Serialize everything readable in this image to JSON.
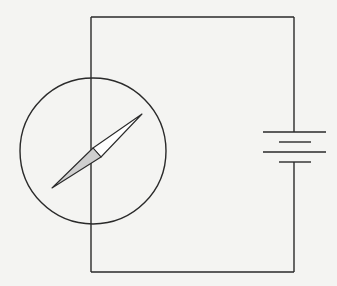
{
  "diagram": {
    "components": [
      {
        "type": "wire-loop",
        "label": "rectangular circuit wire"
      },
      {
        "type": "compass",
        "label": "compass",
        "needle": {
          "north_color": "#ffffff",
          "south_color": "#cfcfcf"
        }
      },
      {
        "type": "battery",
        "label": "battery cells",
        "cells": 2
      }
    ],
    "colors": {
      "background": "#f4f4f2",
      "line": "#2a2a2a",
      "needle_shaded": "#cfcfcf"
    }
  }
}
